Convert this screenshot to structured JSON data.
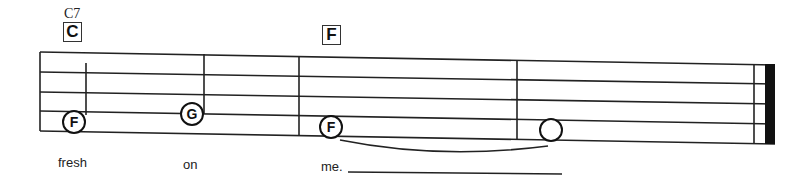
{
  "chords": [
    {
      "small_label": "C7",
      "box_label": "C"
    },
    {
      "box_label": "F"
    }
  ],
  "notes": [
    {
      "letter": "F"
    },
    {
      "letter": "G"
    },
    {
      "letter": "F"
    },
    {
      "letter": ""
    }
  ],
  "lyrics": [
    {
      "text": "fresh"
    },
    {
      "text": "on"
    },
    {
      "text": "me."
    }
  ],
  "colors": {
    "ink": "#111111",
    "background": "#ffffff"
  }
}
